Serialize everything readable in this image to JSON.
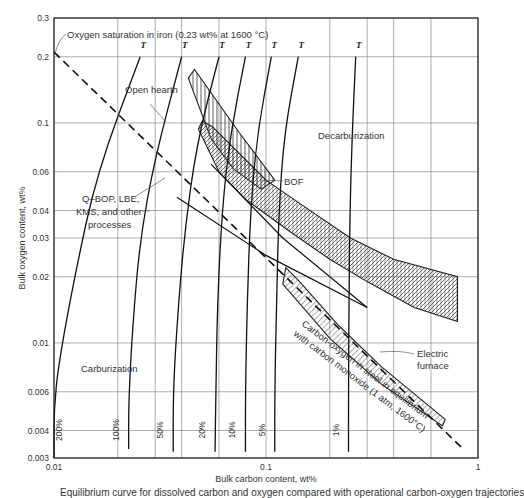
{
  "chart_data": {
    "type": "line",
    "xlabel": "Bulk carbon content, wt%",
    "ylabel": "Bulk oxygen content, wt%",
    "xscale": "log",
    "yscale": "log",
    "xlim": [
      0.01,
      1
    ],
    "ylim": [
      0.003,
      0.3
    ],
    "grid": true,
    "x_ticks": [
      {
        "value": 0.01,
        "label": "0.01"
      },
      {
        "value": 0.1,
        "label": "0.1"
      },
      {
        "value": 1,
        "label": "1"
      }
    ],
    "x_gridlines": [
      0.01,
      0.02,
      0.03,
      0.04,
      0.06,
      0.1,
      0.2,
      0.3,
      0.4,
      0.6,
      1
    ],
    "y_ticks": [
      {
        "value": 0.003,
        "label": "0.003"
      },
      {
        "value": 0.004,
        "label": "0.004"
      },
      {
        "value": 0.006,
        "label": "0.006"
      },
      {
        "value": 0.01,
        "label": "0.01"
      },
      {
        "value": 0.02,
        "label": "0.02"
      },
      {
        "value": 0.03,
        "label": "0.03"
      },
      {
        "value": 0.04,
        "label": "0.04"
      },
      {
        "value": 0.06,
        "label": "0.06"
      },
      {
        "value": 0.1,
        "label": "0.1"
      },
      {
        "value": 0.2,
        "label": "0.2"
      },
      {
        "value": 0.3,
        "label": "0.3"
      }
    ],
    "equilibrium_line": {
      "name": "Carbon-oxygen in steel in equilibrium with carbon monoxide (1 atm, 1600°C)",
      "style": "dashed",
      "points": [
        [
          0.01,
          0.21
        ],
        [
          0.85,
          0.0033
        ]
      ]
    },
    "pressure_curves": [
      {
        "label": "200%",
        "points": [
          [
            0.0255,
            0.2
          ],
          [
            0.016,
            0.06
          ],
          [
            0.0125,
            0.02
          ],
          [
            0.0105,
            0.008
          ],
          [
            0.01,
            0.005
          ],
          [
            0.01,
            0.003
          ]
        ]
      },
      {
        "label": "100%",
        "points": [
          [
            0.04,
            0.2
          ],
          [
            0.03,
            0.07
          ],
          [
            0.0255,
            0.03
          ],
          [
            0.0235,
            0.012
          ],
          [
            0.0225,
            0.0055
          ],
          [
            0.0225,
            0.0033
          ]
        ]
      },
      {
        "label": "50%",
        "points": [
          [
            0.06,
            0.2
          ],
          [
            0.047,
            0.08
          ],
          [
            0.041,
            0.03
          ],
          [
            0.038,
            0.012
          ],
          [
            0.0365,
            0.006
          ],
          [
            0.0365,
            0.0032
          ]
        ]
      },
      {
        "label": "20%",
        "points": [
          [
            0.08,
            0.2
          ],
          [
            0.068,
            0.09
          ],
          [
            0.062,
            0.04
          ],
          [
            0.059,
            0.015
          ],
          [
            0.058,
            0.006
          ],
          [
            0.0575,
            0.0032
          ]
        ]
      },
      {
        "label": "10%",
        "points": [
          [
            0.106,
            0.2
          ],
          [
            0.091,
            0.09
          ],
          [
            0.0845,
            0.04
          ],
          [
            0.0815,
            0.015
          ],
          [
            0.08,
            0.006
          ],
          [
            0.08,
            0.0032
          ]
        ]
      },
      {
        "label": "5%",
        "points": [
          [
            0.142,
            0.2
          ],
          [
            0.122,
            0.09
          ],
          [
            0.115,
            0.04
          ],
          [
            0.112,
            0.015
          ],
          [
            0.11,
            0.006
          ],
          [
            0.11,
            0.0032
          ]
        ]
      },
      {
        "label": "1%",
        "points": [
          [
            0.265,
            0.2
          ],
          [
            0.255,
            0.09
          ],
          [
            0.249,
            0.04
          ],
          [
            0.246,
            0.015
          ],
          [
            0.245,
            0.006
          ],
          [
            0.245,
            0.0032
          ]
        ]
      }
    ],
    "regions": [
      {
        "name": "Open hearth",
        "hatch": "vertical",
        "polygon": [
          [
            0.043,
            0.16
          ],
          [
            0.046,
            0.175
          ],
          [
            0.075,
            0.09
          ],
          [
            0.11,
            0.055
          ],
          [
            0.095,
            0.05
          ],
          [
            0.07,
            0.062
          ],
          [
            0.055,
            0.085
          ]
        ]
      },
      {
        "name": "BOF",
        "hatch": "cross",
        "polygon": [
          [
            0.05,
            0.102
          ],
          [
            0.056,
            0.096
          ],
          [
            0.1,
            0.055
          ],
          [
            0.15,
            0.042
          ],
          [
            0.25,
            0.03
          ],
          [
            0.4,
            0.024
          ],
          [
            0.8,
            0.02
          ],
          [
            0.8,
            0.0125
          ],
          [
            0.5,
            0.0145
          ],
          [
            0.3,
            0.019
          ],
          [
            0.2,
            0.024
          ],
          [
            0.13,
            0.032
          ],
          [
            0.08,
            0.045
          ],
          [
            0.06,
            0.06
          ],
          [
            0.048,
            0.094
          ]
        ]
      },
      {
        "name": "Electric furnace",
        "hatch": "diagonal",
        "polygon": [
          [
            0.124,
            0.022
          ],
          [
            0.144,
            0.019
          ],
          [
            0.22,
            0.012
          ],
          [
            0.35,
            0.0078
          ],
          [
            0.7,
            0.0045
          ],
          [
            0.68,
            0.0042
          ],
          [
            0.35,
            0.0065
          ],
          [
            0.2,
            0.0105
          ],
          [
            0.12,
            0.0185
          ]
        ]
      }
    ],
    "process_lines": [
      {
        "name": "Q-BOP, LBE, KMS, and other processes",
        "points": [
          [
            0.055,
            0.065
          ],
          [
            0.12,
            0.03
          ],
          [
            0.3,
            0.0145
          ]
        ]
      },
      {
        "name": "Q-BOP, LBE, KMS, and other processes",
        "points": [
          [
            0.038,
            0.046
          ],
          [
            0.1,
            0.025
          ],
          [
            0.3,
            0.0145
          ]
        ]
      }
    ],
    "annotations": [
      {
        "text": "Oxygen saturation in iron (0.23 wt% at 1600 °C)"
      },
      {
        "text": "Open hearth"
      },
      {
        "text": "BOF"
      },
      {
        "text": "Decarburization"
      },
      {
        "text": "Q–BOP, LBE,"
      },
      {
        "text": "KMS, and other"
      },
      {
        "text": "processes"
      },
      {
        "text": "Carburization"
      },
      {
        "text": "Electric"
      },
      {
        "text": "furnace"
      },
      {
        "text": "Carbon-oxygen in steel in equilibrium"
      },
      {
        "text": "with carbon monoxide (1 atm, 1600°C)"
      }
    ],
    "curve_marker": "T"
  },
  "caption": "Equilibrium curve for dissolved carbon and oxygen compared with operational carbon-oxygen trajectories"
}
